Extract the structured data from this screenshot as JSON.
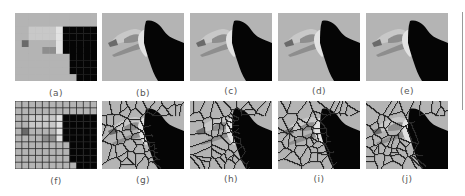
{
  "figure": {
    "top_row": [
      {
        "id": "a",
        "label": "(a)",
        "style": "pixelated"
      },
      {
        "id": "b",
        "label": "(b)",
        "style": "smooth-regions"
      },
      {
        "id": "c",
        "label": "(c)",
        "style": "smooth-regions"
      },
      {
        "id": "d",
        "label": "(d)",
        "style": "smooth-regions"
      },
      {
        "id": "e",
        "label": "(e)",
        "style": "smooth-regions"
      }
    ],
    "bottom_row": [
      {
        "id": "f",
        "label": "(f)",
        "style": "pixel-grid"
      },
      {
        "id": "g",
        "label": "(g)",
        "style": "voronoi-cells"
      },
      {
        "id": "h",
        "label": "(h)",
        "style": "voronoi-cells"
      },
      {
        "id": "i",
        "label": "(i)",
        "style": "voronoi-cells"
      },
      {
        "id": "j",
        "label": "(j)",
        "style": "voronoi-cells"
      }
    ],
    "colors": {
      "background": "#b4b4b4",
      "bird_body": "#050505",
      "cheek": "#e2e2e2",
      "beak_dark": "#6a6a6a",
      "beak_mid": "#8e8e8e",
      "beak_light": "#c8c8c8",
      "cell_edge": "#2a2a2a"
    }
  }
}
